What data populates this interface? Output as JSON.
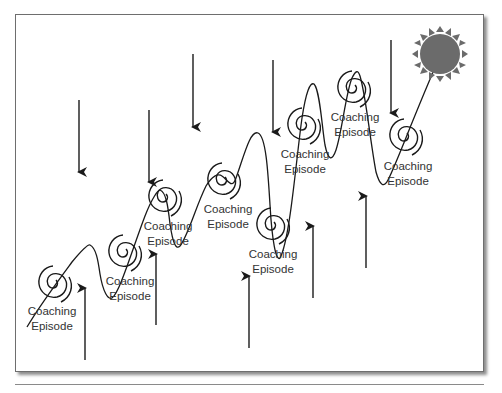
{
  "diagram": {
    "type": "coaching-growth-path",
    "episode_label_line1": "Coaching",
    "episode_label_line2": "Episode",
    "episodes": [
      {
        "id": 1,
        "spiral": [
          54,
          283
        ],
        "label": [
          52,
          309
        ]
      },
      {
        "id": 2,
        "spiral": [
          124,
          252
        ],
        "label": [
          130,
          279
        ]
      },
      {
        "id": 3,
        "spiral": [
          164,
          197
        ],
        "label": [
          168,
          226
        ]
      },
      {
        "id": 4,
        "spiral": [
          223,
          180
        ],
        "label": [
          228,
          210
        ]
      },
      {
        "id": 5,
        "spiral": [
          272,
          225
        ],
        "label": [
          273,
          255
        ]
      },
      {
        "id": 6,
        "spiral": [
          303,
          125
        ],
        "label": [
          305,
          155
        ]
      },
      {
        "id": 7,
        "spiral": [
          353,
          88
        ],
        "label": [
          355,
          119
        ]
      },
      {
        "id": 8,
        "spiral": [
          405,
          136
        ],
        "label": [
          408,
          167
        ]
      }
    ],
    "down_arrows": [
      {
        "x": 79,
        "y1": 100,
        "y2": 172
      },
      {
        "x": 149,
        "y1": 110,
        "y2": 182
      },
      {
        "x": 193,
        "y1": 54,
        "y2": 127
      },
      {
        "x": 273,
        "y1": 60,
        "y2": 132
      },
      {
        "x": 391,
        "y1": 40,
        "y2": 113
      }
    ],
    "up_arrows": [
      {
        "x": 85,
        "y1": 360,
        "y2": 288
      },
      {
        "x": 156,
        "y1": 325,
        "y2": 254
      },
      {
        "x": 249,
        "y1": 348,
        "y2": 276
      },
      {
        "x": 313,
        "y1": 298,
        "y2": 226
      },
      {
        "x": 366,
        "y1": 268,
        "y2": 196
      }
    ],
    "sun": {
      "cx": 440,
      "cy": 54,
      "r": 20,
      "color": "#6b6b6b"
    },
    "colors": {
      "line": "#1a1a1a",
      "arrow": "#1a1a1a",
      "border": "#6e6e6e",
      "text": "#333333"
    }
  }
}
